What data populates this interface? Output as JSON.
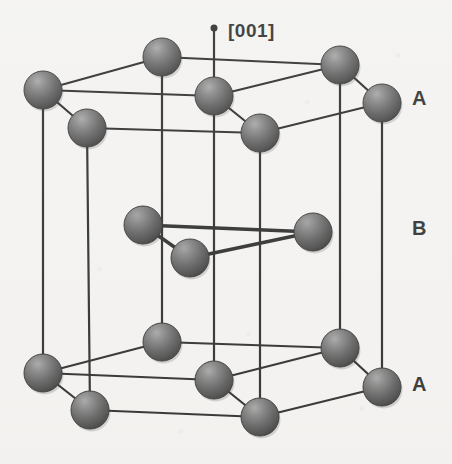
{
  "figure": {
    "kind": "crystal-structure-diagram",
    "background_color": "#f4f3f1",
    "bond_color": "#1a1a1a",
    "atom_color_dark": "#3a3a3a",
    "atom_color_light": "#8e8e8e",
    "label_color": "#1d1d1d",
    "width": 452,
    "height": 464
  },
  "axis": {
    "label": "[001]",
    "label_x": 228,
    "label_y": 21,
    "tip_x": 214,
    "tip_y": 28,
    "base_x": 214,
    "base_y": 96,
    "dot_radius": 3.5
  },
  "layer_labels": [
    {
      "text": "A",
      "x": 412,
      "y": 88,
      "layer": "top"
    },
    {
      "text": "B",
      "x": 412,
      "y": 218,
      "layer": "middle"
    },
    {
      "text": "A",
      "x": 412,
      "y": 374,
      "layer": "bottom"
    }
  ],
  "atoms": {
    "radius": 19,
    "top_layer_A": [
      {
        "id": "tA-back-left",
        "x": 43,
        "y": 90
      },
      {
        "id": "tA-back-center",
        "x": 162,
        "y": 57
      },
      {
        "id": "tA-back-right",
        "x": 340,
        "y": 65
      },
      {
        "id": "tA-center",
        "x": 214,
        "y": 96
      },
      {
        "id": "tA-front-left",
        "x": 87,
        "y": 128
      },
      {
        "id": "tA-front-center",
        "x": 260,
        "y": 133
      },
      {
        "id": "tA-front-right",
        "x": 382,
        "y": 103
      }
    ],
    "middle_layer_B": [
      {
        "id": "B-left",
        "x": 143,
        "y": 225
      },
      {
        "id": "B-front",
        "x": 190,
        "y": 258
      },
      {
        "id": "B-right",
        "x": 313,
        "y": 232
      }
    ],
    "bottom_layer_A": [
      {
        "id": "bA-back-left",
        "x": 43,
        "y": 373
      },
      {
        "id": "bA-back-center",
        "x": 162,
        "y": 342
      },
      {
        "id": "bA-back-right",
        "x": 340,
        "y": 348
      },
      {
        "id": "bA-center",
        "x": 214,
        "y": 380
      },
      {
        "id": "bA-front-left",
        "x": 90,
        "y": 410
      },
      {
        "id": "bA-front-center",
        "x": 260,
        "y": 417
      },
      {
        "id": "bA-front-right",
        "x": 382,
        "y": 387
      }
    ]
  },
  "bonds": {
    "line_width": 2.2,
    "top_hexagon": [
      [
        "tA-back-left",
        "tA-back-center"
      ],
      [
        "tA-back-center",
        "tA-back-right"
      ],
      [
        "tA-back-right",
        "tA-front-right"
      ],
      [
        "tA-front-right",
        "tA-front-center"
      ],
      [
        "tA-front-center",
        "tA-front-left"
      ],
      [
        "tA-front-left",
        "tA-back-left"
      ],
      [
        "tA-back-left",
        "tA-center"
      ],
      [
        "tA-center",
        "tA-back-right"
      ],
      [
        "tA-center",
        "tA-front-center"
      ]
    ],
    "bottom_hexagon": [
      [
        "bA-back-left",
        "bA-back-center"
      ],
      [
        "bA-back-center",
        "bA-back-right"
      ],
      [
        "bA-back-right",
        "bA-front-right"
      ],
      [
        "bA-front-right",
        "bA-front-center"
      ],
      [
        "bA-front-center",
        "bA-front-left"
      ],
      [
        "bA-front-left",
        "bA-back-left"
      ],
      [
        "bA-back-left",
        "bA-center"
      ],
      [
        "bA-center",
        "bA-back-right"
      ],
      [
        "bA-center",
        "bA-front-center"
      ]
    ],
    "middle_triangle": [
      [
        "B-left",
        "B-right"
      ],
      [
        "B-left",
        "B-front"
      ],
      [
        "B-front",
        "B-right"
      ]
    ],
    "verticals": [
      [
        "tA-back-left",
        "bA-back-left"
      ],
      [
        "tA-back-center",
        "bA-back-center"
      ],
      [
        "tA-back-right",
        "bA-back-right"
      ],
      [
        "tA-center",
        "bA-center"
      ],
      [
        "tA-front-left",
        "bA-front-left"
      ],
      [
        "tA-front-center",
        "bA-front-center"
      ],
      [
        "tA-front-right",
        "bA-front-right"
      ]
    ]
  }
}
